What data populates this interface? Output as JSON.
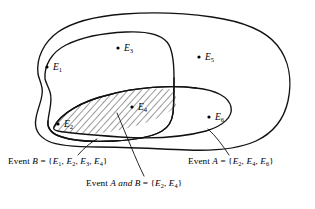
{
  "figure": {
    "name": "venn-diagram-events-a-and-b",
    "type": "venn-diagram",
    "background_color": "#ffffff",
    "line_color": "#111111"
  },
  "sample_space": {
    "label": "sample-space-outline",
    "outcomes": [
      "E1",
      "E2",
      "E3",
      "E4",
      "E5",
      "E6"
    ]
  },
  "points": [
    {
      "id": "E1",
      "base": "E",
      "sub": "1",
      "x": 47,
      "y": 67,
      "label": "E1"
    },
    {
      "id": "E2",
      "base": "E",
      "sub": "2",
      "x": 58,
      "y": 124,
      "label": "E2"
    },
    {
      "id": "E3",
      "base": "E",
      "sub": "3",
      "x": 118,
      "y": 48,
      "label": "E3"
    },
    {
      "id": "E4",
      "base": "E",
      "sub": "4",
      "x": 132,
      "y": 107,
      "label": "E4"
    },
    {
      "id": "E5",
      "base": "E",
      "sub": "5",
      "x": 199,
      "y": 57,
      "label": "E5"
    },
    {
      "id": "E6",
      "base": "E",
      "sub": "6",
      "x": 209,
      "y": 117,
      "label": "E6"
    }
  ],
  "captions": {
    "event_b": {
      "prefix": "Event B = {",
      "items": [
        "E1",
        "E2",
        "E3",
        "E4"
      ],
      "suffix": "}",
      "full_text": "Event B = {E1, E2, E3, E4}"
    },
    "event_a": {
      "prefix": "Event A = {",
      "items": [
        "E2",
        "E4",
        "E6"
      ],
      "suffix": "}",
      "full_text": "Event A = {E2, E4, E6}"
    },
    "event_a_and_b": {
      "prefix": "Event A and B = {",
      "items": [
        "E2",
        "E4"
      ],
      "suffix": "}",
      "italic_word": "and",
      "full_text": "Event A and B = {E2, E4}"
    }
  },
  "regions": {
    "event_a": {
      "name": "event-a-oval",
      "contains": [
        "E2",
        "E4",
        "E6"
      ]
    },
    "event_b": {
      "name": "event-b-blob",
      "contains": [
        "E1",
        "E2",
        "E3",
        "E4"
      ]
    },
    "intersection": {
      "name": "event-a-and-b-hatched-region",
      "contains": [
        "E2",
        "E4"
      ],
      "fill_pattern": "diagonal-hatch"
    }
  }
}
